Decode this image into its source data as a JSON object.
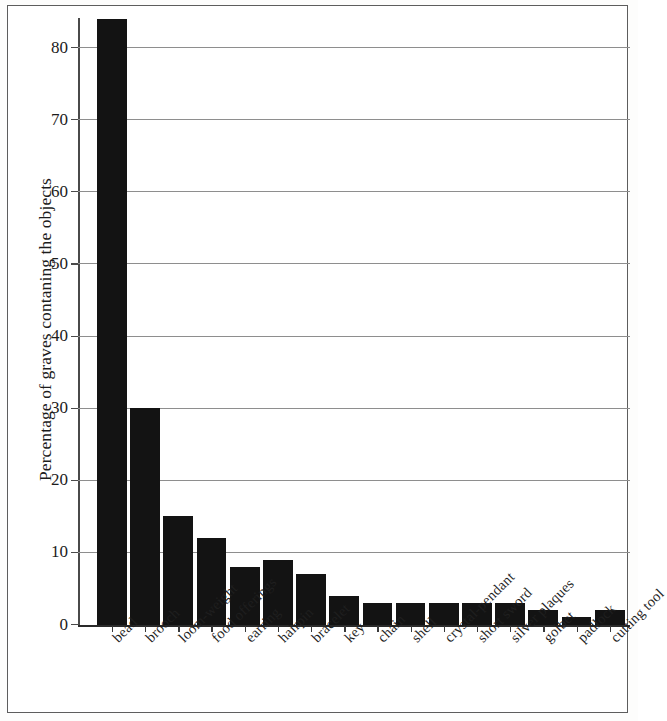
{
  "chart_data": {
    "type": "bar",
    "title": "",
    "subtitle": "",
    "xlabel": "",
    "ylabel": "Percentage of graves contaning the objects",
    "ylim": [
      0,
      86
    ],
    "yticks": [
      0,
      10,
      20,
      30,
      40,
      50,
      60,
      70,
      80
    ],
    "ytick_labels": [
      "0",
      "10",
      "20",
      "30",
      "40",
      "50",
      "60",
      "70",
      "80"
    ],
    "grid": true,
    "legend": false,
    "legend_position": "none",
    "bar_color": "#131313",
    "categories": [
      "bead",
      "brooch",
      "loom-weight",
      "food offerings",
      "earring",
      "hairpin",
      "bracelet",
      "key",
      "chain",
      "shell",
      "crystal-pendant",
      "short sword",
      "silver plaques",
      "golbet",
      "padlock",
      "cutting tool"
    ],
    "values": [
      84,
      30,
      15,
      12,
      8,
      9,
      7,
      4,
      3,
      3,
      3,
      3,
      3,
      2,
      1,
      2
    ],
    "series": [
      {
        "name": "Percentage of graves contaning the objects",
        "values": [
          84,
          30,
          15,
          12,
          8,
          9,
          7,
          4,
          3,
          3,
          3,
          3,
          3,
          2,
          1,
          2
        ]
      }
    ]
  },
  "figure": {
    "frame_color": "#5d5d5d",
    "background": "#ffffff",
    "axis_color": "#2a2a2a",
    "grid_color": "#8e8e8e"
  }
}
